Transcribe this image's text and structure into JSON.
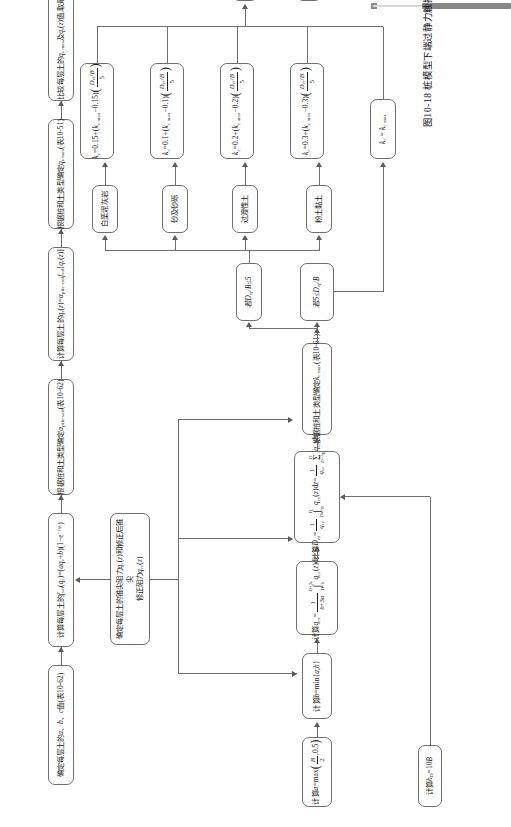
{
  "figure": {
    "caption": "图10-18  桩模型下端过静力触探试验端阻及侧阻图",
    "connector_label": "B",
    "line_color": "#6f6f6f"
  },
  "top_strip": {
    "scrollbar_name": "horizontal-scrollbar"
  },
  "main_chain": [
    {
      "id": "c1",
      "text": "确定每层土的a、b、c值(表10-62)"
    },
    {
      "id": "c2",
      "text": "计算每层土的f_ct(q_c)=(aq_c+b)(1-e^(-cq_c))"
    },
    {
      "id": "c3",
      "text": "根据桩和土类型确定α_p/Fm-cal(表10-62)"
    },
    {
      "id": "c4",
      "text": "计算每层土的q_s(z)=α_p/Fm-cal f_sol[q_c(z)]"
    },
    {
      "id": "c5",
      "text": "根据桩和土类型确定q_s max(表10-51)"
    },
    {
      "id": "c6",
      "text": "比较每层土的q_s max及q_s(z)值,取最小值"
    },
    {
      "id": "c7",
      "text": "计算每层土中桩的侧长P_s"
    },
    {
      "id": "c8",
      "text": "计算桩侧承载力R_s = P_s ∫₀^D q_s(z)dz"
    }
  ],
  "branch_head": {
    "id": "b0",
    "text": "确定每层土的锥尖阻力q_c(z)和修正后锥尖修正阻力q_cc(z)"
  },
  "left_chain": [
    {
      "id": "l0",
      "text": "计算 h_D = 10B"
    },
    {
      "id": "l1",
      "text": "计算 a = max( B/2 , 0.5 )"
    },
    {
      "id": "l2",
      "text": "计算 b = min{a; h}"
    },
    {
      "id": "l3",
      "text": "计算 q_ce = 1/(b+3a) ∫ q_cc(z)dz"
    },
    {
      "id": "l4",
      "text": "计算 D_ef = (1/q_ce) ∫₀^D q_cc(z)dz = (1/q_ce) Σ q_cc,i h_i"
    },
    {
      "id": "l5",
      "text": "根据桩和土类型确定 k_c max (表10-61)"
    }
  ],
  "decisions": [
    {
      "id": "d1",
      "text": "若 D_ef/B ≤ 5"
    },
    {
      "id": "d2",
      "text": "若 5 ≤ D_ef/B"
    }
  ],
  "soil_types": [
    {
      "id": "s1",
      "text": "粉土黏土"
    },
    {
      "id": "s2",
      "text": "过渡性土"
    },
    {
      "id": "s3",
      "text": "砂及砂砾"
    },
    {
      "id": "s4",
      "text": "白垩泥灰岩"
    }
  ],
  "kc_formulas": [
    {
      "id": "k1",
      "text": "k_c = 0.3 + (k_c max − 0.3)( (D_ef/B)/5 )"
    },
    {
      "id": "k2",
      "text": "k_c = 0.2 + (k_c max − 0.2)( (D_ef/B)/5 )"
    },
    {
      "id": "k3",
      "text": "k_c = 0.1 + (k_c max − 0.1)( (D_ef/B)/5 )"
    },
    {
      "id": "k4",
      "text": "k_c = 0.15 + (k_c max − 0.15)( (D_ef/B)/5 )"
    }
  ],
  "kc_else": {
    "id": "k5",
    "text": "k_c = k_c max"
  },
  "tail_chain": [
    {
      "id": "t1",
      "text": "计算 q_b = k_c q_ce"
    },
    {
      "id": "t2",
      "text": "计算 R_b,k = A_b q_b"
    }
  ]
}
